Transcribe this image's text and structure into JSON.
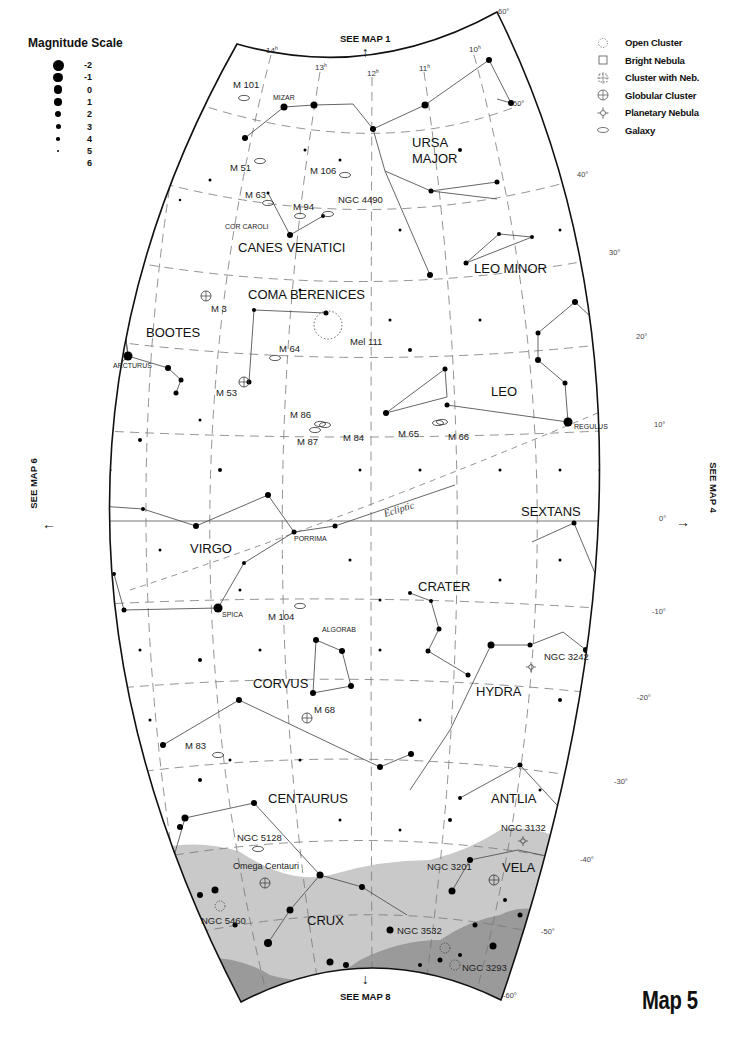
{
  "title": "Map 5",
  "magnitude_legend": {
    "title": "Magnitude Scale",
    "items": [
      {
        "label": "-2",
        "size": 11
      },
      {
        "label": "-1",
        "size": 9.5
      },
      {
        "label": "0",
        "size": 8.5
      },
      {
        "label": "1",
        "size": 7.5
      },
      {
        "label": "2",
        "size": 6.5
      },
      {
        "label": "3",
        "size": 5
      },
      {
        "label": "4",
        "size": 3.5
      },
      {
        "label": "5",
        "size": 2
      },
      {
        "label": "6",
        "size": 0
      }
    ]
  },
  "object_legend": [
    {
      "symbol": "open-cluster",
      "label": "Open Cluster"
    },
    {
      "symbol": "bright-nebula",
      "label": "Bright Nebula"
    },
    {
      "symbol": "cluster-with-nebula",
      "label": "Cluster with Neb."
    },
    {
      "symbol": "globular-cluster",
      "label": "Globular Cluster"
    },
    {
      "symbol": "planetary-nebula",
      "label": "Planetary Nebula"
    },
    {
      "symbol": "galaxy",
      "label": "Galaxy"
    }
  ],
  "navigation": {
    "up": "SEE MAP 1",
    "down": "SEE MAP 8",
    "left": "SEE MAP 6",
    "right": "SEE MAP 4"
  },
  "ra_labels": [
    {
      "label": "14h",
      "x": 266,
      "y": 53
    },
    {
      "label": "13h",
      "x": 315,
      "y": 70
    },
    {
      "label": "12h",
      "x": 367,
      "y": 76
    },
    {
      "label": "11h",
      "x": 419,
      "y": 71
    },
    {
      "label": "10h",
      "x": 469,
      "y": 52
    }
  ],
  "dec_labels": [
    {
      "label": "60°",
      "x": 498,
      "y": 14
    },
    {
      "label": "50°",
      "x": 513,
      "y": 106
    },
    {
      "label": "40°",
      "x": 577,
      "y": 177
    },
    {
      "label": "30°",
      "x": 609,
      "y": 255
    },
    {
      "label": "20°",
      "x": 636,
      "y": 339
    },
    {
      "label": "10°",
      "x": 654,
      "y": 427
    },
    {
      "label": "0°",
      "x": 659,
      "y": 521
    },
    {
      "label": "-10°",
      "x": 652,
      "y": 614
    },
    {
      "label": "-20°",
      "x": 637,
      "y": 700
    },
    {
      "label": "-30°",
      "x": 614,
      "y": 784
    },
    {
      "label": "-40°",
      "x": 580,
      "y": 862
    },
    {
      "label": "-50°",
      "x": 541,
      "y": 934
    },
    {
      "label": "-60°",
      "x": 503,
      "y": 998
    }
  ],
  "constellations": [
    {
      "name": "URSA",
      "x": 412,
      "y": 147
    },
    {
      "name": "MAJOR",
      "x": 412,
      "y": 163
    },
    {
      "name": "CANES VENATICI",
      "x": 238,
      "y": 252
    },
    {
      "name": "LEO MINOR",
      "x": 474,
      "y": 273
    },
    {
      "name": "COMA BERENICES",
      "x": 248,
      "y": 299
    },
    {
      "name": "BOOTES",
      "x": 146,
      "y": 337
    },
    {
      "name": "LEO",
      "x": 491,
      "y": 396
    },
    {
      "name": "SEXTANS",
      "x": 521,
      "y": 516
    },
    {
      "name": "VIRGO",
      "x": 190,
      "y": 553
    },
    {
      "name": "CRATER",
      "x": 418,
      "y": 591
    },
    {
      "name": "CORVUS",
      "x": 253,
      "y": 688
    },
    {
      "name": "HYDRA",
      "x": 476,
      "y": 696
    },
    {
      "name": "CENTAURUS",
      "x": 268,
      "y": 803
    },
    {
      "name": "ANTLIA",
      "x": 491,
      "y": 803
    },
    {
      "name": "VELA",
      "x": 502,
      "y": 872
    },
    {
      "name": "CRUX",
      "x": 307,
      "y": 925
    }
  ],
  "star_names": [
    {
      "name": "MIZAR",
      "x": 273,
      "y": 100
    },
    {
      "name": "COR CAROLI",
      "x": 225,
      "y": 229
    },
    {
      "name": "ARCTURUS",
      "x": 113,
      "y": 368
    },
    {
      "name": "REGULUS",
      "x": 574,
      "y": 429
    },
    {
      "name": "PORRIMA",
      "x": 294,
      "y": 541
    },
    {
      "name": "SPICA",
      "x": 222,
      "y": 617
    },
    {
      "name": "ALGORAB",
      "x": 322,
      "y": 632
    }
  ],
  "deep_sky_objects": [
    {
      "name": "M 101",
      "type": "galaxy",
      "label_x": 233,
      "label_y": 88,
      "x": 244,
      "y": 98
    },
    {
      "name": "M 51",
      "type": "galaxy",
      "label_x": 230,
      "label_y": 171,
      "x": 260,
      "y": 161
    },
    {
      "name": "M 106",
      "type": "galaxy",
      "label_x": 310,
      "label_y": 174,
      "x": 345,
      "y": 175
    },
    {
      "name": "M 63",
      "type": "galaxy",
      "label_x": 245,
      "label_y": 198,
      "x": 268,
      "y": 203
    },
    {
      "name": "M 94",
      "type": "galaxy",
      "label_x": 293,
      "label_y": 210,
      "x": 300,
      "y": 216
    },
    {
      "name": "NGC 4490",
      "type": "galaxy",
      "label_x": 338,
      "label_y": 203,
      "x": 328,
      "y": 214
    },
    {
      "name": "M 3",
      "type": "globular",
      "label_x": 211,
      "label_y": 312,
      "x": 206,
      "y": 296
    },
    {
      "name": "Mel 111",
      "type": "open",
      "label_x": 350,
      "label_y": 345,
      "x": 330,
      "y": 328
    },
    {
      "name": "M 64",
      "type": "galaxy",
      "label_x": 279,
      "label_y": 352,
      "x": 275,
      "y": 358
    },
    {
      "name": "M 53",
      "type": "globular",
      "label_x": 216,
      "label_y": 396,
      "x": 244,
      "y": 382
    },
    {
      "name": "M 86",
      "type": "galaxy",
      "label_x": 290,
      "label_y": 418,
      "x": 325,
      "y": 425
    },
    {
      "name": "M 84",
      "type": "galaxy",
      "label_x": 343,
      "label_y": 441,
      "x": 320,
      "y": 424
    },
    {
      "name": "M 87",
      "type": "galaxy",
      "label_x": 297,
      "label_y": 445,
      "x": 315,
      "y": 430
    },
    {
      "name": "M 65",
      "type": "galaxy",
      "label_x": 398,
      "label_y": 437,
      "x": 438,
      "y": 423
    },
    {
      "name": "M 66",
      "type": "galaxy",
      "label_x": 448,
      "label_y": 440,
      "x": 442,
      "y": 422
    },
    {
      "name": "M 104",
      "type": "galaxy",
      "label_x": 268,
      "label_y": 620,
      "x": 300,
      "y": 606
    },
    {
      "name": "M 68",
      "type": "globular",
      "label_x": 314,
      "label_y": 713,
      "x": 307,
      "y": 718
    },
    {
      "name": "NGC 3242",
      "type": "planetary",
      "label_x": 544,
      "label_y": 660,
      "x": 531,
      "y": 667
    },
    {
      "name": "M 83",
      "type": "galaxy",
      "label_x": 185,
      "label_y": 749,
      "x": 218,
      "y": 755
    },
    {
      "name": "NGC 5128",
      "type": "galaxy",
      "label_x": 237,
      "label_y": 841,
      "x": 258,
      "y": 849
    },
    {
      "name": "NGC 3132",
      "type": "planetary",
      "label_x": 501,
      "label_y": 831,
      "x": 523,
      "y": 841
    },
    {
      "name": "Omega Centauri",
      "type": "globular",
      "label_x": 233,
      "label_y": 869,
      "x": 265,
      "y": 883
    },
    {
      "name": "NGC 3201",
      "type": "globular",
      "label_x": 427,
      "label_y": 870,
      "x": 494,
      "y": 880
    },
    {
      "name": "NGC 5460",
      "type": "open",
      "label_x": 201,
      "label_y": 924,
      "x": 220,
      "y": 906
    },
    {
      "name": "NGC 3532",
      "type": "open",
      "label_x": 397,
      "label_y": 934,
      "x": 445,
      "y": 948
    },
    {
      "name": "NGC 3293",
      "type": "open",
      "label_x": 462,
      "label_y": 971,
      "x": 455,
      "y": 965
    }
  ],
  "ecliptic_label": "Ecliptic",
  "colors": {
    "milky_way_light": "#c9c9c9",
    "milky_way_dark": "#9a9a9a",
    "grid": "#777777",
    "border": "#111111"
  }
}
